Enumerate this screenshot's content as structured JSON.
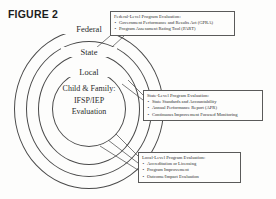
{
  "figure": {
    "title": "FIGURE 2"
  },
  "diagram": {
    "type": "concentric-rings",
    "rings": [
      {
        "id": "federal",
        "label": "Federal"
      },
      {
        "id": "state",
        "label": "State"
      },
      {
        "id": "local",
        "label": "Local"
      },
      {
        "id": "core",
        "label": ""
      }
    ],
    "core": {
      "line1": "Child & Family:",
      "line2": "IFSP/IEP",
      "line3": "Evaluation"
    }
  },
  "callouts": [
    {
      "id": "federal",
      "heading": "Federal-Level Program Evaluation:",
      "items": [
        "Government Performance and Results Act (GPRA)",
        "Program Assessment Rating Tool (PART)"
      ]
    },
    {
      "id": "state",
      "heading": "State-Level Program Evaluation:",
      "items": [
        "State Standards and Accountability",
        "Annual Performance Report (APR)",
        "Continuous Improvement Focused Monitoring"
      ]
    },
    {
      "id": "local",
      "heading": "Local-Level Program Evaluation:",
      "items": [
        "Accreditation or Licensing",
        "Program Improvement",
        "Outcome/Impact Evaluation"
      ]
    }
  ],
  "colors": {
    "stroke": "#4a4a4a",
    "box_stroke": "#5a5a5a",
    "text": "#2b2b2b",
    "background": "#fdfdfc"
  }
}
